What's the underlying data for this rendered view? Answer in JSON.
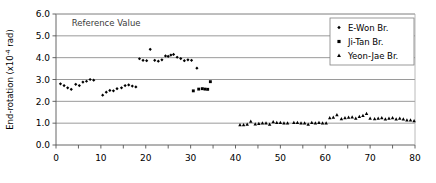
{
  "chart_data": {
    "type": "scatter",
    "title": "",
    "xlabel": "",
    "ylabel": "End-rotation (x10 -4 rad)",
    "ylabel_main": "End-rotation (x10",
    "ylabel_exp": "-4",
    "ylabel_tail": " rad)",
    "xlim": [
      0,
      80
    ],
    "ylim": [
      0,
      6.0
    ],
    "xticks": [
      0,
      5,
      10,
      15,
      20,
      25,
      30,
      35,
      40,
      45,
      50,
      55,
      60,
      65,
      70,
      75,
      80
    ],
    "xtick_labels": [
      "0",
      "",
      "10",
      "",
      "20",
      "",
      "30",
      "",
      "40",
      "",
      "50",
      "",
      "60",
      "",
      "70",
      "",
      "80"
    ],
    "yticks": [
      0.0,
      1.0,
      2.0,
      3.0,
      4.0,
      5.0,
      6.0
    ],
    "ytick_labels": [
      "0.0",
      "1.0",
      "2.0",
      "3.0",
      "4.0",
      "5.0",
      "6.0"
    ],
    "grid": "horizontal",
    "grid_color": "#808080",
    "annotations": [
      {
        "text": "Reference Value",
        "x": 3.5,
        "y": 5.45,
        "color": "#3a3a3a"
      }
    ],
    "legend": {
      "position": "top-right",
      "border_color": "#808080",
      "entries": [
        {
          "name": "E-Won Br.",
          "marker": "diamond",
          "color": "#000000"
        },
        {
          "name": "Ji-Tan Br.",
          "marker": "square",
          "color": "#000000"
        },
        {
          "name": "Yeon-Jae Br.",
          "marker": "triangle",
          "color": "#000000"
        }
      ]
    },
    "series": [
      {
        "name": "E-Won Br.",
        "marker": "diamond",
        "color": "#000000",
        "points": [
          [
            1.0,
            2.8
          ],
          [
            1.8,
            2.72
          ],
          [
            2.6,
            2.62
          ],
          [
            3.4,
            2.55
          ],
          [
            4.4,
            2.78
          ],
          [
            5.2,
            2.72
          ],
          [
            6.0,
            2.88
          ],
          [
            6.8,
            2.92
          ],
          [
            7.6,
            3.0
          ],
          [
            8.4,
            2.97
          ],
          [
            10.4,
            2.28
          ],
          [
            11.2,
            2.42
          ],
          [
            12.0,
            2.5
          ],
          [
            12.8,
            2.48
          ],
          [
            13.6,
            2.58
          ],
          [
            14.6,
            2.62
          ],
          [
            15.4,
            2.72
          ],
          [
            16.2,
            2.75
          ],
          [
            17.0,
            2.7
          ],
          [
            17.8,
            2.66
          ],
          [
            18.6,
            3.95
          ],
          [
            19.4,
            3.88
          ],
          [
            20.2,
            3.86
          ],
          [
            21.0,
            4.38
          ],
          [
            22.0,
            3.88
          ],
          [
            22.8,
            3.84
          ],
          [
            23.6,
            3.9
          ],
          [
            24.4,
            4.08
          ],
          [
            25.0,
            4.06
          ],
          [
            25.6,
            4.12
          ],
          [
            26.2,
            4.15
          ],
          [
            27.0,
            4.02
          ],
          [
            27.8,
            3.96
          ],
          [
            28.6,
            3.86
          ],
          [
            29.4,
            3.9
          ],
          [
            30.2,
            3.88
          ],
          [
            31.4,
            3.52
          ]
        ]
      },
      {
        "name": "Ji-Tan Br.",
        "marker": "square",
        "color": "#000000",
        "points": [
          [
            30.6,
            2.48
          ],
          [
            31.8,
            2.56
          ],
          [
            32.6,
            2.58
          ],
          [
            33.2,
            2.56
          ],
          [
            33.8,
            2.55
          ],
          [
            34.4,
            2.9
          ]
        ]
      },
      {
        "name": "Yeon-Jae Br.",
        "marker": "triangle",
        "color": "#000000",
        "points": [
          [
            41.0,
            0.92
          ],
          [
            41.8,
            0.92
          ],
          [
            42.6,
            0.94
          ],
          [
            43.4,
            1.08
          ],
          [
            44.4,
            0.96
          ],
          [
            45.2,
            0.98
          ],
          [
            46.0,
            1.0
          ],
          [
            46.8,
            1.0
          ],
          [
            47.6,
            0.94
          ],
          [
            48.4,
            1.06
          ],
          [
            49.2,
            1.02
          ],
          [
            50.0,
            1.02
          ],
          [
            50.8,
            1.0
          ],
          [
            51.6,
            1.0
          ],
          [
            53.0,
            1.02
          ],
          [
            53.8,
            1.02
          ],
          [
            54.6,
            1.0
          ],
          [
            55.4,
            1.0
          ],
          [
            56.2,
            0.94
          ],
          [
            57.0,
            1.02
          ],
          [
            57.8,
            1.0
          ],
          [
            58.6,
            1.02
          ],
          [
            59.4,
            1.0
          ],
          [
            60.2,
            1.0
          ],
          [
            61.0,
            1.24
          ],
          [
            61.8,
            1.26
          ],
          [
            62.6,
            1.38
          ],
          [
            63.6,
            1.2
          ],
          [
            64.4,
            1.24
          ],
          [
            65.2,
            1.26
          ],
          [
            66.0,
            1.28
          ],
          [
            66.8,
            1.22
          ],
          [
            67.6,
            1.3
          ],
          [
            68.4,
            1.34
          ],
          [
            69.2,
            1.44
          ],
          [
            70.0,
            1.22
          ],
          [
            71.0,
            1.2
          ],
          [
            71.8,
            1.22
          ],
          [
            72.6,
            1.24
          ],
          [
            73.4,
            1.18
          ],
          [
            74.2,
            1.22
          ],
          [
            75.0,
            1.24
          ],
          [
            75.8,
            1.18
          ],
          [
            76.6,
            1.22
          ],
          [
            77.4,
            1.18
          ],
          [
            78.2,
            1.14
          ],
          [
            79.0,
            1.14
          ],
          [
            79.8,
            1.1
          ]
        ]
      }
    ]
  }
}
